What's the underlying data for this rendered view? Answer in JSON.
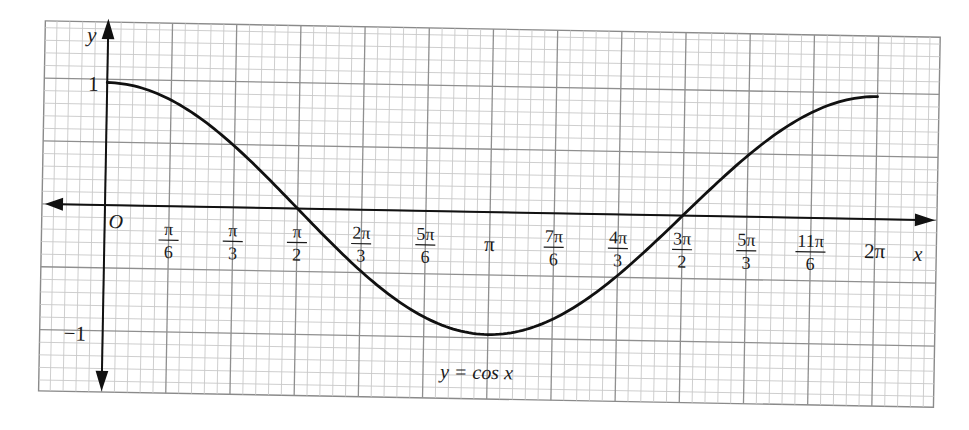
{
  "chart_data": {
    "type": "line",
    "title": "",
    "function_label": "y = cos x",
    "xlabel": "x",
    "ylabel": "y",
    "origin_label": "O",
    "x_ticks": [
      {
        "num": "π",
        "den": "6",
        "value": 0.5236
      },
      {
        "num": "π",
        "den": "3",
        "value": 1.0472
      },
      {
        "num": "π",
        "den": "2",
        "value": 1.5708
      },
      {
        "num": "2π",
        "den": "3",
        "value": 2.0944
      },
      {
        "num": "5π",
        "den": "6",
        "value": 2.618
      },
      {
        "num": "π",
        "den": "",
        "value": 3.1416
      },
      {
        "num": "7π",
        "den": "6",
        "value": 3.6652
      },
      {
        "num": "4π",
        "den": "3",
        "value": 4.1888
      },
      {
        "num": "3π",
        "den": "2",
        "value": 4.7124
      },
      {
        "num": "5π",
        "den": "3",
        "value": 5.236
      },
      {
        "num": "11π",
        "den": "6",
        "value": 5.7596
      },
      {
        "num": "2π",
        "den": "",
        "value": 6.2832
      }
    ],
    "y_ticks": [
      {
        "label": "1",
        "value": 1
      },
      {
        "label": "−1",
        "value": -1
      }
    ],
    "series": [
      {
        "name": "y = cos x",
        "x": [
          0,
          0.5236,
          1.0472,
          1.5708,
          2.0944,
          2.618,
          3.1416,
          3.6652,
          4.1888,
          4.7124,
          5.236,
          5.7596,
          6.2832
        ],
        "y": [
          1,
          0.866,
          0.5,
          0,
          -0.5,
          -0.866,
          -1,
          -0.866,
          -0.5,
          0,
          0.5,
          0.866,
          1
        ]
      }
    ],
    "xlim": [
      0,
      6.2832
    ],
    "ylim": [
      -1.4,
      1.5
    ],
    "grid": true,
    "grid_style": "graph paper, 5 minor divisions per major",
    "legend": "none",
    "colors": {
      "curve": "#111111",
      "axis": "#111111",
      "major_grid": "#8a8a8a",
      "minor_grid": "#c4c4c4",
      "background": "#ffffff"
    }
  }
}
